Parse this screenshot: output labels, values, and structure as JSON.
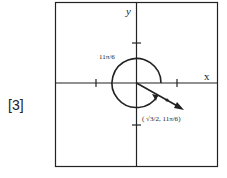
{
  "problem_number": "[3]",
  "axes": {
    "x_label": "x",
    "y_label": "y"
  },
  "angle_label": "11π/6",
  "point_label": {
    "open": "(",
    "r": "√3/2",
    "sep": ",",
    "theta": "11π/6",
    "close": ")"
  },
  "colors": {
    "stroke": "#222222",
    "background": "#ffffff"
  }
}
